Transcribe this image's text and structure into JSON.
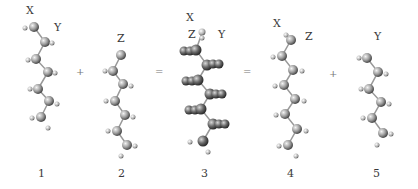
{
  "figure": {
    "structures": [
      {
        "id": "1",
        "number": "1",
        "labels": [
          "X",
          "Y"
        ]
      },
      {
        "id": "2",
        "number": "2",
        "labels": [
          "Z"
        ]
      },
      {
        "id": "3",
        "number": "3",
        "labels": [
          "X",
          "Z",
          "Y"
        ]
      },
      {
        "id": "4",
        "number": "4",
        "labels": [
          "X",
          "Z"
        ]
      },
      {
        "id": "5",
        "number": "5",
        "labels": [
          "Y"
        ]
      }
    ],
    "operators": [
      "+",
      "=",
      "=",
      "+"
    ]
  }
}
